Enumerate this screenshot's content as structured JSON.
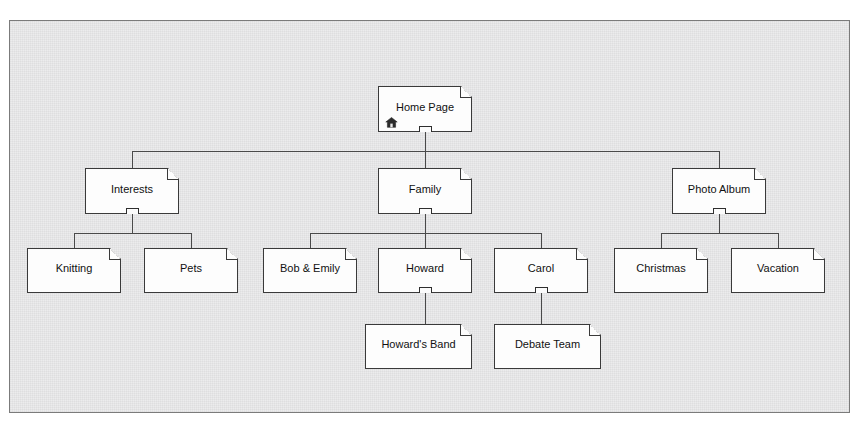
{
  "diagram": {
    "type": "tree",
    "background_color": "#ececed",
    "frame_border_color": "#7b7b7b",
    "node_fill_color": "#fdfdfd",
    "node_border_color": "#3a3a3a",
    "connector_color": "#4a4a4a"
  },
  "nodes": {
    "home_page": {
      "label": "Home Page",
      "icon": "home-icon",
      "control": "minus"
    },
    "interests": {
      "label": "Interests",
      "control": "minus"
    },
    "family": {
      "label": "Family",
      "control": "minus"
    },
    "photo_album": {
      "label": "Photo Album",
      "control": "minus"
    },
    "knitting": {
      "label": "Knitting",
      "control": "none"
    },
    "pets": {
      "label": "Pets",
      "control": "none"
    },
    "bob_emily": {
      "label": "Bob & Emily",
      "control": "none"
    },
    "howard": {
      "label": "Howard",
      "control": "minus"
    },
    "carol": {
      "label": "Carol",
      "control": "minus"
    },
    "christmas": {
      "label": "Christmas",
      "control": "none"
    },
    "vacation": {
      "label": "Vacation",
      "control": "none"
    },
    "howards_band": {
      "label": "Howard's Band",
      "control": "none"
    },
    "debate_team": {
      "label": "Debate Team",
      "control": "none"
    }
  },
  "hierarchy": {
    "root": "Home Page",
    "level_2": [
      "Interests",
      "Family",
      "Photo Album"
    ],
    "level_3": [
      "Knitting",
      "Pets",
      "Bob & Emily",
      "Howard",
      "Carol",
      "Christmas",
      "Vacation"
    ],
    "level_4": [
      "Howard's Band",
      "Debate Team"
    ],
    "edges": [
      [
        "Home Page",
        "Interests"
      ],
      [
        "Home Page",
        "Family"
      ],
      [
        "Home Page",
        "Photo Album"
      ],
      [
        "Interests",
        "Knitting"
      ],
      [
        "Interests",
        "Pets"
      ],
      [
        "Family",
        "Bob & Emily"
      ],
      [
        "Family",
        "Howard"
      ],
      [
        "Family",
        "Carol"
      ],
      [
        "Photo Album",
        "Christmas"
      ],
      [
        "Photo Album",
        "Vacation"
      ],
      [
        "Howard",
        "Howard's Band"
      ],
      [
        "Carol",
        "Debate Team"
      ]
    ]
  }
}
